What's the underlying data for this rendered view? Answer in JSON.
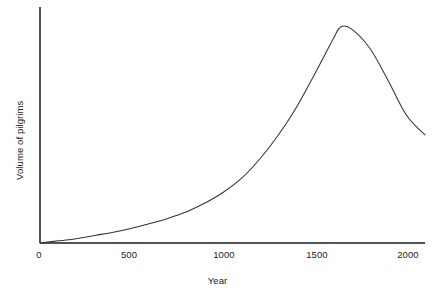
{
  "figure": {
    "background_color": "#ffffff",
    "line_color": "#333333",
    "axis_color": "#555555",
    "width": 435,
    "height": 295
  },
  "chart_data": {
    "type": "line",
    "title": "",
    "subtitle": "",
    "xlabel": "Year",
    "ylabel": "Volume of pilgrims",
    "xlim": [
      0,
      2100
    ],
    "ylim": [
      0,
      1.06
    ],
    "grid": false,
    "legend": false,
    "legend_position": "none",
    "x_tick_labels": [
      "0",
      "500",
      "1000",
      "1500",
      "2000"
    ],
    "x_ticks": [
      0,
      500,
      1000,
      1500,
      2000
    ],
    "y_tick_labels": [],
    "y_ticks": [],
    "annotations": [],
    "series": [
      {
        "name": "Volume of pilgrims",
        "color": "#333333",
        "x": [
          0,
          100,
          200,
          300,
          400,
          500,
          600,
          700,
          800,
          900,
          1000,
          1100,
          1200,
          1300,
          1400,
          1500,
          1600,
          1640,
          1700,
          1800,
          1900,
          2000,
          2100
        ],
        "values": [
          0.0,
          0.01,
          0.02,
          0.035,
          0.05,
          0.068,
          0.09,
          0.115,
          0.145,
          0.185,
          0.235,
          0.3,
          0.39,
          0.5,
          0.63,
          0.785,
          0.945,
          1.0,
          0.99,
          0.9,
          0.75,
          0.59,
          0.5
        ]
      }
    ]
  },
  "axis": {
    "x_axis_name": "x-axis-line",
    "y_axis_name": "y-axis-line"
  }
}
